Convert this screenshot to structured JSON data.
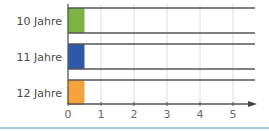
{
  "chart_data": {
    "type": "bar",
    "orientation": "horizontal",
    "title": "",
    "xlabel": "",
    "ylabel": "",
    "categories": [
      "10 Jahre",
      "11 Jahre",
      "12 Jahre"
    ],
    "values": [
      0.5,
      0.5,
      0.5
    ],
    "colors": [
      "#7cb342",
      "#2f5aa8",
      "#f5a43c"
    ],
    "xlim": [
      0,
      5
    ],
    "xticks": [
      0,
      1,
      2,
      3,
      4,
      5
    ],
    "grid": true,
    "legend": null
  }
}
